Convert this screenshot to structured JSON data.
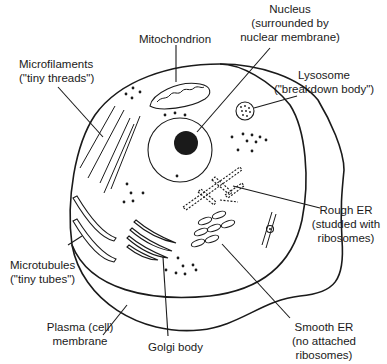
{
  "labels": {
    "mitochondrion": {
      "line1": "Mitochondrion"
    },
    "nucleus": {
      "line1": "Nucleus",
      "line2": "(surrounded by",
      "line3": "nuclear membrane)"
    },
    "microfilaments": {
      "line1": "Microfilaments",
      "line2": "(\"tiny threads\")"
    },
    "lysosome": {
      "line1": "Lysosome",
      "line2": "(\"breakdown body\")"
    },
    "rough_er": {
      "line1": "Rough ER",
      "line2": "(studded with",
      "line3": "ribosomes)"
    },
    "microtubules": {
      "line1": "Microtubules",
      "line2": "(\"tiny tubes\")"
    },
    "plasma_membrane": {
      "line1": "Plasma (cell)",
      "line2": "membrane"
    },
    "golgi": {
      "line1": "Golgi body"
    },
    "smooth_er": {
      "line1": "Smooth ER",
      "line2": "(no attached",
      "line3": "ribosomes)"
    }
  },
  "colors": {
    "ink": "#1a1a1a",
    "background": "#ffffff"
  }
}
